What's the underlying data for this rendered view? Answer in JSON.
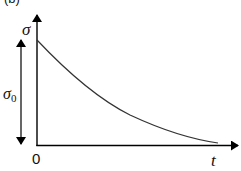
{
  "figure": {
    "panel_label": "(b)",
    "y_axis_label": "σ",
    "x_axis_label": "t",
    "origin_label": "0",
    "amplitude_label": "σ",
    "amplitude_subscript": "0",
    "curve_description": "exponential decay of stress σ over time t from initial value σ0"
  },
  "colors": {
    "axis": "#000000",
    "curve": "#333333",
    "background": "#ffffff"
  }
}
